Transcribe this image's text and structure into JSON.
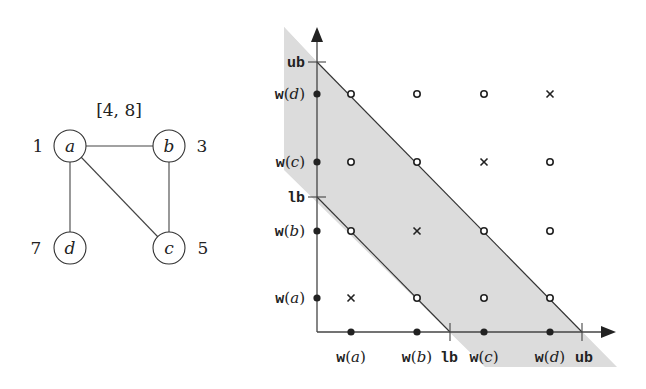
{
  "graph": {
    "interval_label": "[4, 8]",
    "nodes": [
      {
        "id": "a",
        "label": "a",
        "weight": "1",
        "cx": 70,
        "cy": 146,
        "weight_x": 38,
        "weight_anchor": "middle"
      },
      {
        "id": "b",
        "label": "b",
        "weight": "3",
        "cx": 169,
        "cy": 146,
        "weight_x": 202,
        "weight_anchor": "middle"
      },
      {
        "id": "c",
        "label": "c",
        "weight": "5",
        "cx": 169,
        "cy": 248,
        "weight_x": 203,
        "weight_anchor": "middle"
      },
      {
        "id": "d",
        "label": "d",
        "weight": "7",
        "cx": 70,
        "cy": 248,
        "weight_x": 36,
        "weight_anchor": "middle"
      }
    ],
    "edges": [
      [
        "a",
        "b"
      ],
      [
        "a",
        "d"
      ],
      [
        "a",
        "c"
      ],
      [
        "b",
        "c"
      ]
    ]
  },
  "plot": {
    "x_axis": {
      "ticks": [
        {
          "label": "w(a)",
          "fn": "w",
          "arg": "a",
          "x": 351,
          "kind": "point"
        },
        {
          "label": "w(b)",
          "fn": "w",
          "arg": "b",
          "x": 417,
          "kind": "point"
        },
        {
          "label": "lb",
          "x": 450,
          "kind": "tick"
        },
        {
          "label": "w(c)",
          "fn": "w",
          "arg": "c",
          "x": 484,
          "kind": "point"
        },
        {
          "label": "w(d)",
          "fn": "w",
          "arg": "d",
          "x": 550,
          "kind": "point"
        },
        {
          "label": "ub",
          "x": 582,
          "kind": "tick"
        }
      ]
    },
    "y_axis": {
      "ticks": [
        {
          "label": "ub",
          "y": 62,
          "kind": "tick"
        },
        {
          "label": "w(d)",
          "fn": "w",
          "arg": "d",
          "y": 94,
          "kind": "point"
        },
        {
          "label": "w(c)",
          "fn": "w",
          "arg": "c",
          "y": 162,
          "kind": "point"
        },
        {
          "label": "lb",
          "y": 197,
          "kind": "tick"
        },
        {
          "label": "w(b)",
          "fn": "w",
          "arg": "b",
          "y": 231,
          "kind": "point"
        },
        {
          "label": "w(a)",
          "fn": "w",
          "arg": "a",
          "y": 298,
          "kind": "point"
        }
      ]
    },
    "grid": {
      "columns": [
        "a",
        "b",
        "c",
        "d"
      ],
      "rows": [
        "d",
        "c",
        "b",
        "a"
      ],
      "markers": [
        [
          "o",
          "o",
          "o",
          "x"
        ],
        [
          "o",
          "o",
          "x",
          "o"
        ],
        [
          "o",
          "x",
          "o",
          "o"
        ],
        [
          "x",
          "o",
          "o",
          "o"
        ]
      ]
    },
    "shaded_region": {
      "fill": "#d9d9d9",
      "description": "band between lb and ub diagonals"
    }
  }
}
